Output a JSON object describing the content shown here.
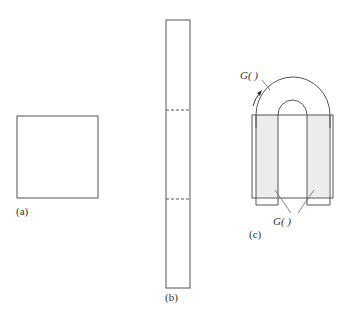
{
  "figure": {
    "panels": [
      {
        "id": "a",
        "label": "(a)",
        "shape": "square"
      },
      {
        "id": "b",
        "label": "(b)",
        "shape": "tall-strip",
        "fold_lines": 2
      },
      {
        "id": "c",
        "label": "(c)",
        "shape": "folded-U",
        "annotations": [
          {
            "id": "top",
            "text": "G(   )"
          },
          {
            "id": "bottom",
            "text": "G(   )"
          }
        ]
      }
    ],
    "colors": {
      "stroke": "#555555",
      "fill_shaded": "#ececec",
      "background": "#ffffff"
    }
  }
}
